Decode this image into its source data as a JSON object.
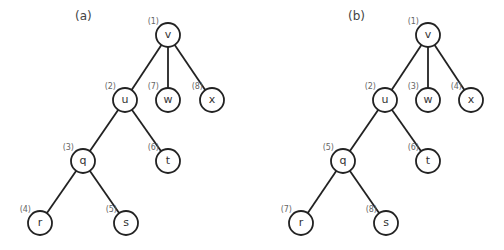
{
  "panels": [
    {
      "id": "a",
      "label": "(a)",
      "label_pos": [
        75,
        20
      ],
      "nodes": [
        {
          "id": "v",
          "label": "v",
          "order": "(1)",
          "x": 168,
          "y": 35
        },
        {
          "id": "u",
          "label": "u",
          "order": "(2)",
          "x": 125,
          "y": 100
        },
        {
          "id": "w",
          "label": "w",
          "order": "(7)",
          "x": 168,
          "y": 100
        },
        {
          "id": "x",
          "label": "x",
          "order": "(8)",
          "x": 212,
          "y": 100
        },
        {
          "id": "q",
          "label": "q",
          "order": "(3)",
          "x": 83,
          "y": 161
        },
        {
          "id": "t",
          "label": "t",
          "order": "(6)",
          "x": 168,
          "y": 161
        },
        {
          "id": "r",
          "label": "r",
          "order": "(4)",
          "x": 40,
          "y": 223
        },
        {
          "id": "s",
          "label": "s",
          "order": "(5)",
          "x": 126,
          "y": 223
        }
      ],
      "edges": [
        [
          "v",
          "u"
        ],
        [
          "v",
          "w"
        ],
        [
          "v",
          "x"
        ],
        [
          "u",
          "q"
        ],
        [
          "u",
          "t"
        ],
        [
          "q",
          "r"
        ],
        [
          "q",
          "s"
        ]
      ]
    },
    {
      "id": "b",
      "label": "(b)",
      "label_pos": [
        348,
        20
      ],
      "nodes": [
        {
          "id": "v",
          "label": "v",
          "order": "(1)",
          "x": 428,
          "y": 35
        },
        {
          "id": "u",
          "label": "u",
          "order": "(2)",
          "x": 385,
          "y": 100
        },
        {
          "id": "w",
          "label": "w",
          "order": "(3)",
          "x": 428,
          "y": 100
        },
        {
          "id": "x",
          "label": "x",
          "order": "(4)",
          "x": 471,
          "y": 100
        },
        {
          "id": "q",
          "label": "q",
          "order": "(5)",
          "x": 343,
          "y": 161
        },
        {
          "id": "t",
          "label": "t",
          "order": "(6)",
          "x": 428,
          "y": 161
        },
        {
          "id": "r",
          "label": "r",
          "order": "(7)",
          "x": 301,
          "y": 223
        },
        {
          "id": "s",
          "label": "s",
          "order": "(8)",
          "x": 386,
          "y": 223
        }
      ],
      "edges": [
        [
          "v",
          "u"
        ],
        [
          "v",
          "w"
        ],
        [
          "v",
          "x"
        ],
        [
          "u",
          "q"
        ],
        [
          "u",
          "t"
        ],
        [
          "q",
          "r"
        ],
        [
          "q",
          "s"
        ]
      ]
    }
  ],
  "style": {
    "node_radius": 12,
    "stroke_color": "#222222",
    "order_label_color": "#666666"
  }
}
